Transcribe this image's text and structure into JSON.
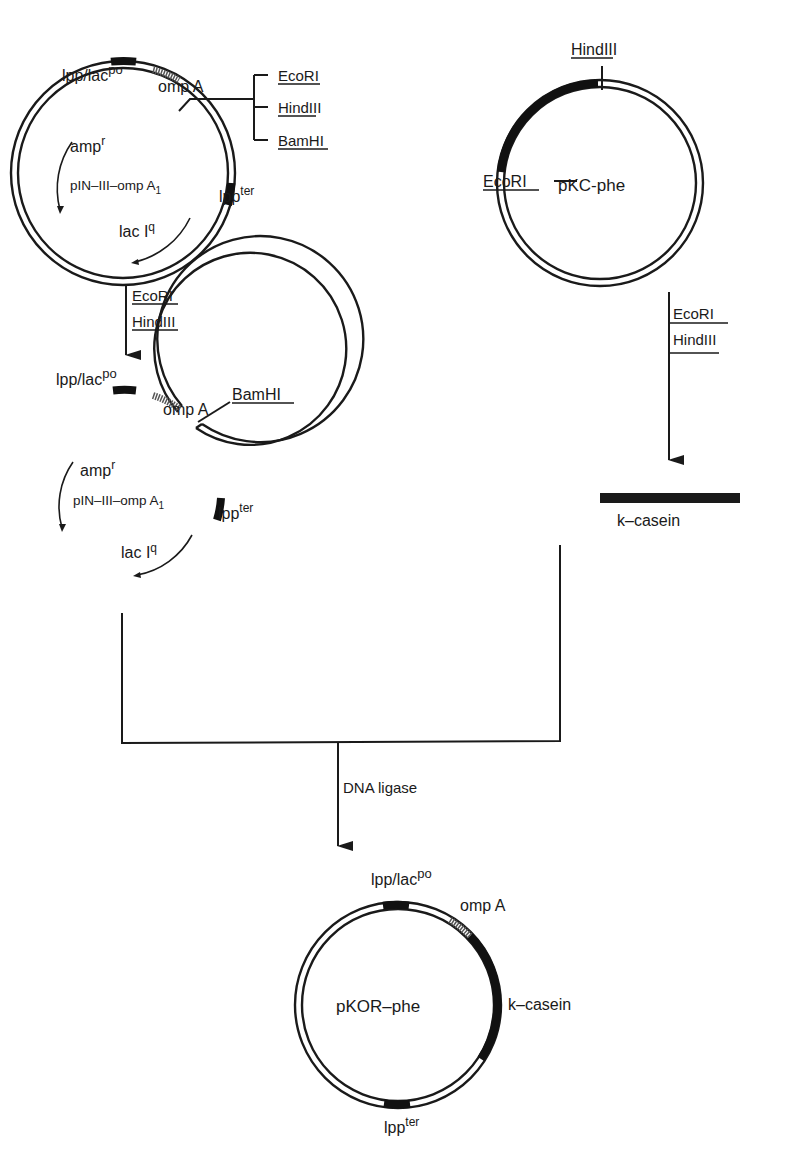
{
  "figure": {
    "type": "plasmid construction scheme",
    "plasmid_1": {
      "name": "pIN–III–omp A",
      "name_subscript": "1",
      "labels": {
        "promoter": "lpp/lac",
        "promoter_sup": "po",
        "signal": "omp A",
        "terminator": "lpp",
        "terminator_sup": "ter",
        "resistance": "amp",
        "resistance_sup": "r",
        "repressor": "lac I",
        "repressor_sup": "q"
      },
      "polylinker_sites": [
        {
          "underlined": "EcoR",
          "rest": "I"
        },
        {
          "underlined": "Hind",
          "rest": "III"
        },
        {
          "underlined": "BamH",
          "rest": "I"
        }
      ]
    },
    "plasmid_2": {
      "name": "pKC-phe",
      "sites": [
        {
          "underlined": "Hind",
          "rest": "III"
        },
        {
          "underlined": "EcoR",
          "rest": "I"
        }
      ]
    },
    "digest_left": {
      "enzymes": [
        {
          "underlined": "EcoR",
          "rest": "I"
        },
        {
          "underlined": "Hind",
          "rest": "III"
        }
      ]
    },
    "digest_right": {
      "enzymes": [
        {
          "underlined": "EcoR",
          "rest": "I"
        },
        {
          "underlined": "Hind",
          "rest": "III"
        }
      ]
    },
    "cut_vector": {
      "name": "pIN–III–omp A",
      "name_subscript": "1",
      "labels": {
        "promoter": "lpp/lac",
        "promoter_sup": "po",
        "signal": "omp A",
        "site": {
          "underlined": "BamH",
          "rest": "I"
        },
        "terminator": "lpp",
        "terminator_sup": "ter",
        "resistance": "amp",
        "resistance_sup": "r",
        "repressor": "lac I",
        "repressor_sup": "q"
      }
    },
    "fragment": {
      "name": "k–casein"
    },
    "ligation": {
      "label": "DNA ligase"
    },
    "product": {
      "name": "pKOR–phe",
      "labels": {
        "promoter": "lpp/lac",
        "promoter_sup": "po",
        "signal": "omp A",
        "insert": "k–casein",
        "terminator": "lpp",
        "terminator_sup": "ter"
      }
    },
    "colors": {
      "ink": "#1a1a1a",
      "background": "#ffffff"
    }
  }
}
